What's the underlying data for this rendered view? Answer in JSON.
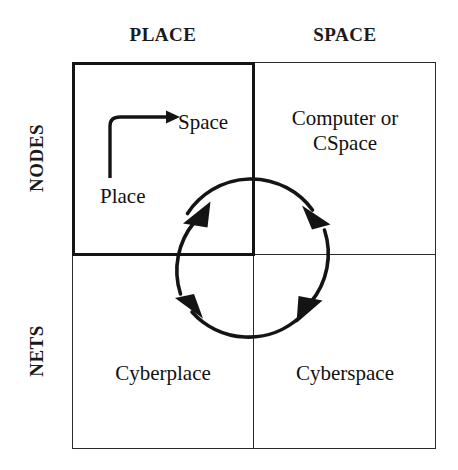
{
  "figure": {
    "background_color": "#ffffff",
    "line_color": "#2b2b2b",
    "text_color": "#111111"
  },
  "columns": [
    {
      "key": "place",
      "label": "PLACE"
    },
    {
      "key": "space",
      "label": "SPACE"
    }
  ],
  "rows": [
    {
      "key": "nodes",
      "label": "NODES"
    },
    {
      "key": "nets",
      "label": "NETS"
    }
  ],
  "cells": {
    "nodes_place": {
      "emphasized": true,
      "inline_from_label": "Place",
      "inline_to_label": "Space",
      "arrow": "place-to-space-elbow-arrow"
    },
    "nodes_space": {
      "label": "Computer or\nCSpace"
    },
    "nets_place": {
      "label": "Cyberplace"
    },
    "nets_space": {
      "label": "Cyberspace"
    }
  },
  "cycle": {
    "name": "clockwise-cycle-arrows",
    "direction": "clockwise",
    "segment_count": 4,
    "arrowheads": [
      "upper-left-arrowhead",
      "upper-right-arrowhead",
      "lower-right-arrowhead",
      "lower-left-arrowhead"
    ]
  }
}
